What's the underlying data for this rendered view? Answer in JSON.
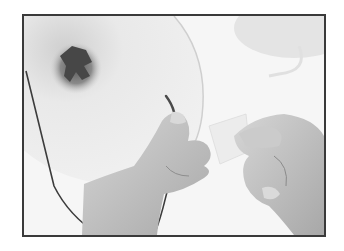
{
  "photo": {
    "subject": "hands threading a wire through a paper cone",
    "colors": {
      "frame": "#3a3a3a",
      "background": "#f4f4f4",
      "cone": "#e6e6e6",
      "cone_shadow": "#d2d2d2",
      "cone_center": "#4a4a4a",
      "skin": "#c4c4c4",
      "skin_shadow": "#9a9a9a",
      "wire": "#3c3c3c",
      "card": "#ececec"
    }
  }
}
